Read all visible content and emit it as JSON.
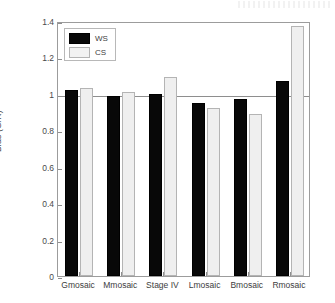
{
  "chart_data": {
    "type": "bar",
    "title": "",
    "subtitle": "",
    "xlabel": "",
    "ylabel": "Bias (G/R)",
    "categories": [
      "Gmosaic",
      "Mmosaic",
      "Stage IV",
      "Lmosaic",
      "Bmosaic",
      "Rmosaic"
    ],
    "series": [
      {
        "name": "WS",
        "color": "#080808",
        "values": [
          1.02,
          0.99,
          1.0,
          0.95,
          0.97,
          1.07
        ]
      },
      {
        "name": "CS",
        "color": "#efefef",
        "values": [
          1.03,
          1.01,
          1.09,
          0.92,
          0.89,
          1.37
        ]
      }
    ],
    "ylim": [
      0,
      1.4
    ],
    "ytick_values": [
      0,
      0.2,
      0.4,
      0.6,
      0.8,
      1,
      1.2,
      1.4
    ],
    "ytick_labels": [
      "0",
      "0.2",
      "0.4",
      "0.6",
      "0.8",
      "1",
      "1.2",
      "1.4"
    ],
    "reference_line": 1.0,
    "grid": false,
    "legend_position": "top-left-inside"
  },
  "legend": {
    "entries": [
      {
        "label": "WS"
      },
      {
        "label": "CS"
      }
    ]
  }
}
